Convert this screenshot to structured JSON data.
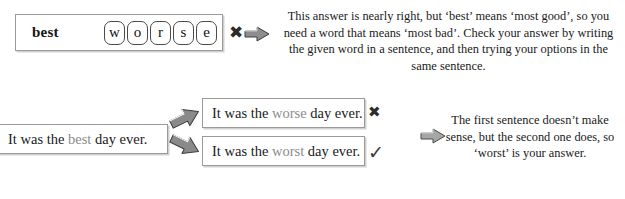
{
  "top_panel": {
    "given_word": "best",
    "tiles": [
      "w",
      "o",
      "r",
      "s",
      "e"
    ],
    "cross_mark": "✖",
    "arrow_icon": "right-arrow-3d",
    "explanation": "This answer is nearly right, but ‘best’ means ‘most good’, so you need a word that means ‘most bad’.  Check your answer by writing the given word in a sentence, and then trying your options in the same sentence."
  },
  "bottom_panel": {
    "source_sentence": {
      "before": "It was the ",
      "highlight": "best",
      "after": " day ever."
    },
    "options": [
      {
        "before": "It was the ",
        "highlight": "worse",
        "after": " day ever.",
        "mark": "✖",
        "mark_kind": "cross"
      },
      {
        "before": "It was the ",
        "highlight": "worst",
        "after": " day ever.",
        "mark": "✓",
        "mark_kind": "check"
      }
    ],
    "explanation": "The first sentence doesn’t make sense, but the second one does, so ‘worst’ is your answer."
  },
  "colors": {
    "highlight_word": "#8c8c8c",
    "box_border": "#9a9a9a",
    "text": "#1a1a1a",
    "arrow_fill": "#6e6e6e",
    "arrow_stroke": "#3a3a3a"
  }
}
